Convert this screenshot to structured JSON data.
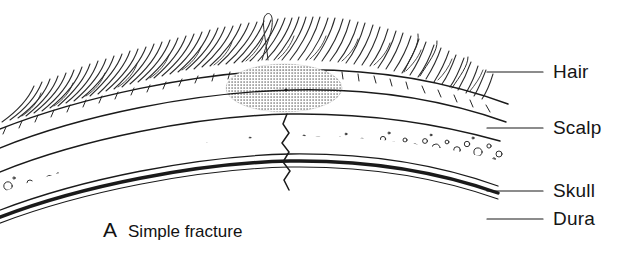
{
  "figure": {
    "panel_letter": "A",
    "caption": "Simple fracture",
    "type": "medical-line-illustration",
    "background_color": "#ffffff",
    "ink_color": "#1a1a1a"
  },
  "labels": [
    {
      "id": "hair",
      "text": "Hair",
      "leader_from_x": 487,
      "leader_to_x": 543,
      "leader_y": 72
    },
    {
      "id": "scalp",
      "text": "Scalp",
      "leader_from_x": 487,
      "leader_to_x": 543,
      "leader_y": 128
    },
    {
      "id": "skull",
      "text": "Skull",
      "leader_from_x": 487,
      "leader_to_x": 543,
      "leader_y": 191
    },
    {
      "id": "dura",
      "text": "Dura",
      "leader_from_x": 487,
      "leader_to_x": 543,
      "leader_y": 219
    }
  ],
  "anatomy": {
    "hematoma": {
      "name": "subgaleal-swelling",
      "shape": "ellipse",
      "center_x": 284,
      "center_y": 88,
      "radius_x": 58,
      "radius_y": 24,
      "fill": "halftone-dots",
      "center_dot": true
    },
    "fracture": {
      "name": "fracture-line",
      "shape": "zigzag",
      "x": 286,
      "y_top": 126,
      "y_bottom": 192
    },
    "layers": [
      {
        "id": "hair-layer",
        "name": "hair-strands",
        "strand_count": 86
      },
      {
        "id": "scalp-layer",
        "name": "scalp-band"
      },
      {
        "id": "skull-layer",
        "name": "skull-diploe",
        "bubble_count": 120
      },
      {
        "id": "dura-layer",
        "name": "dura-mater-band"
      }
    ]
  }
}
